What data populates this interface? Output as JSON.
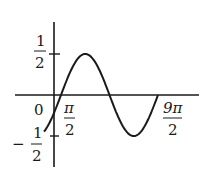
{
  "chart_data": {
    "type": "line",
    "title": "",
    "xlabel": "",
    "ylabel": "",
    "function_description": "sinusoid with amplitude 1/2 and period 2π, phase shifted right by π/4",
    "amplitude": 0.5,
    "ylim": [
      -0.5,
      0.5
    ],
    "x_tick_labels": [
      {
        "label": "0",
        "value": 0
      },
      {
        "label": "π/2",
        "value": 1.5708
      },
      {
        "label": "9π/2",
        "value": 14.137
      }
    ],
    "y_tick_labels": [
      {
        "label": "1/2",
        "value": 0.5
      },
      {
        "label": "-1/2",
        "value": -0.5
      }
    ],
    "key_points": [
      {
        "x": "start",
        "y": -0.35
      },
      {
        "x": "zero crossing (up)",
        "y": 0
      },
      {
        "x": "peak",
        "y": 0.5
      },
      {
        "x": "zero crossing (down)",
        "y": 0
      },
      {
        "x": "trough",
        "y": -0.5
      },
      {
        "x": "end",
        "y": 0.05
      }
    ],
    "grid": false,
    "legend": null,
    "pixel_layout": {
      "origin": [
        54,
        95
      ],
      "y_half_px": 41,
      "curve_start_x": 44,
      "curve_zero_x": 61,
      "period_px": 97,
      "curve_end_x": 158
    }
  },
  "labels": {
    "y_top_num": "1",
    "y_top_den": "2",
    "origin": "0",
    "x_pi_num": "π",
    "x_pi_den": "2",
    "y_bot_sign": "−",
    "y_bot_num": "1",
    "y_bot_den": "2",
    "x_9pi_num": "9π",
    "x_9pi_den": "2"
  },
  "colors": {
    "ink": "#1a1a1a",
    "background": "#ffffff"
  }
}
